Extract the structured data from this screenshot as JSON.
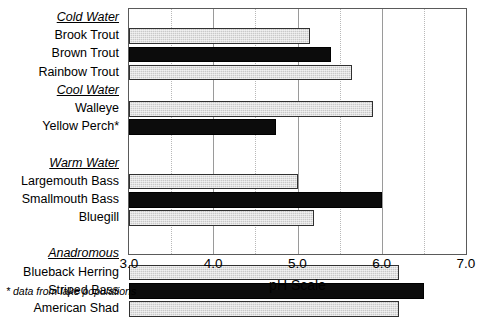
{
  "chart_data": {
    "type": "bar",
    "orientation": "horizontal",
    "title": "",
    "xlabel": "pH Scale",
    "ylabel": "",
    "xlim": [
      3.0,
      7.0
    ],
    "xticks": [
      "3.0",
      "4.0",
      "5.0",
      "6.0",
      "7.0"
    ],
    "xtick_values": [
      3.0,
      4.0,
      5.0,
      6.0,
      7.0
    ],
    "grid": true,
    "legend": "none",
    "footnote": "* data from lake populations",
    "groups": [
      {
        "name": "Cold Water",
        "categories": [
          "Brook Trout",
          "Brown Trout",
          "Rainbow Trout"
        ],
        "values": [
          5.15,
          5.4,
          5.65
        ],
        "fills": [
          "gray",
          "black",
          "gray"
        ]
      },
      {
        "name": "Cool Water",
        "categories": [
          "Walleye",
          "Yellow Perch*"
        ],
        "values": [
          5.9,
          4.75
        ],
        "fills": [
          "gray",
          "black"
        ]
      },
      {
        "name": "Warm Water",
        "categories": [
          "Largemouth Bass",
          "Smallmouth Bass",
          "Bluegill"
        ],
        "values": [
          5.0,
          6.0,
          5.2
        ],
        "fills": [
          "gray",
          "black",
          "gray"
        ]
      },
      {
        "name": "Anadromous",
        "categories": [
          "Blueback Herring",
          "Striped Bass",
          "American Shad"
        ],
        "values": [
          6.2,
          6.5,
          6.2
        ],
        "fills": [
          "gray",
          "black",
          "gray"
        ]
      }
    ],
    "categories": [
      "Brook Trout",
      "Brown Trout",
      "Rainbow Trout",
      "Walleye",
      "Yellow Perch*",
      "Largemouth Bass",
      "Smallmouth Bass",
      "Bluegill",
      "Blueback Herring",
      "Striped Bass",
      "American Shad"
    ],
    "values": [
      5.15,
      5.4,
      5.65,
      5.9,
      4.75,
      5.0,
      6.0,
      5.2,
      6.2,
      6.5,
      6.2
    ],
    "colors": {
      "gray_bar": "#c9c9c9",
      "black_bar": "#0c0c0c",
      "axis": "#5a5a5a",
      "grid": "#b0b0b0"
    }
  },
  "rows": [
    {
      "label": "Cold Water",
      "kind": "group",
      "value": null,
      "fill": "none"
    },
    {
      "label": "Brook Trout",
      "kind": "bar",
      "value": 5.15,
      "fill": "gray"
    },
    {
      "label": "Brown Trout",
      "kind": "bar",
      "value": 5.4,
      "fill": "black"
    },
    {
      "label": "Rainbow Trout",
      "kind": "bar",
      "value": 5.65,
      "fill": "gray"
    },
    {
      "label": "Cool Water",
      "kind": "group",
      "value": null,
      "fill": "none"
    },
    {
      "label": "Walleye",
      "kind": "bar",
      "value": 5.9,
      "fill": "gray"
    },
    {
      "label": "Yellow Perch*",
      "kind": "bar",
      "value": 4.75,
      "fill": "black"
    },
    {
      "label": "",
      "kind": "spacer",
      "value": null,
      "fill": "none"
    },
    {
      "label": "Warm Water",
      "kind": "group",
      "value": null,
      "fill": "none"
    },
    {
      "label": "Largemouth Bass",
      "kind": "bar",
      "value": 5.0,
      "fill": "gray"
    },
    {
      "label": "Smallmouth Bass",
      "kind": "bar",
      "value": 6.0,
      "fill": "black"
    },
    {
      "label": "Bluegill",
      "kind": "bar",
      "value": 5.2,
      "fill": "gray"
    },
    {
      "label": "",
      "kind": "spacer",
      "value": null,
      "fill": "none"
    },
    {
      "label": "Anadromous",
      "kind": "group",
      "value": null,
      "fill": "none"
    },
    {
      "label": "Blueback Herring",
      "kind": "bar",
      "value": 6.2,
      "fill": "gray"
    },
    {
      "label": "Striped Bass",
      "kind": "bar",
      "value": 6.5,
      "fill": "black"
    },
    {
      "label": "American Shad",
      "kind": "bar",
      "value": 6.2,
      "fill": "gray"
    },
    {
      "label": "",
      "kind": "spacer",
      "value": null,
      "fill": "none"
    }
  ],
  "axis": {
    "title": "pH Scale",
    "min": 3.0,
    "max": 7.0,
    "ticks": [
      "3.0",
      "4.0",
      "5.0",
      "6.0",
      "7.0"
    ],
    "minor_per_major": 2
  },
  "footnote": {
    "text": "* data from lake populations"
  }
}
